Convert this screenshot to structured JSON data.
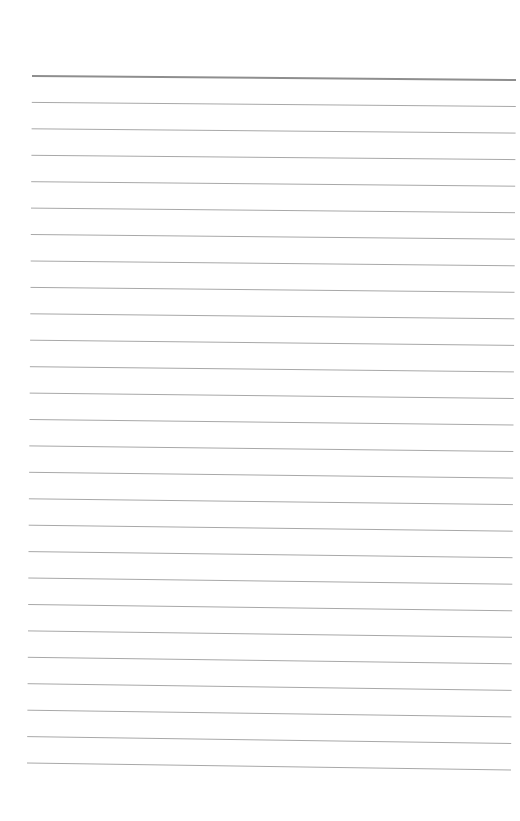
{
  "page": {
    "type": "blank-ruled-paper",
    "background": "#ffffff",
    "line_color": "#a8a8a8",
    "header_line_color": "#8e8e8e",
    "line_count": 27,
    "first_line": {
      "x1": 32,
      "y1": 76,
      "x2": 516,
      "y2": 80,
      "width": 2
    },
    "last_line": {
      "x1": 27,
      "y1": 763,
      "x2": 511,
      "y2": 770,
      "width": 1
    },
    "line_width": 1
  }
}
